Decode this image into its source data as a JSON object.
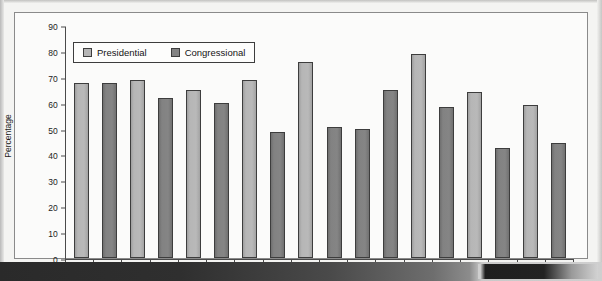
{
  "chart_data": {
    "type": "bar",
    "title": "",
    "xlabel": "",
    "ylabel": "Percentage",
    "ylim": [
      0,
      90
    ],
    "ytick_step": 10,
    "yticks": [
      0,
      10,
      20,
      30,
      40,
      50,
      60,
      70,
      80,
      90
    ],
    "grid": false,
    "legend_position": "top-left",
    "categories": [
      "1958",
      "1961",
      "1964",
      "1967",
      "1970",
      "1973",
      "1976",
      "1979",
      "1982",
      "1985",
      "1988",
      "1991",
      "1994",
      "1997",
      "2000",
      "2004",
      "2006",
      "2009"
    ],
    "series": [
      {
        "name": "Presidential",
        "color": "#b5b5b5"
      },
      {
        "name": "Congressional",
        "color": "#838383"
      }
    ],
    "bars": [
      {
        "category": "1958",
        "value": 68,
        "series": "Presidential"
      },
      {
        "category": "1961",
        "value": 68,
        "series": "Congressional"
      },
      {
        "category": "1964",
        "value": 69,
        "series": "Presidential"
      },
      {
        "category": "1967",
        "value": 62,
        "series": "Congressional"
      },
      {
        "category": "1970",
        "value": 65,
        "series": "Presidential"
      },
      {
        "category": "1973",
        "value": 60,
        "series": "Congressional"
      },
      {
        "category": "1976",
        "value": 69,
        "series": "Presidential"
      },
      {
        "category": "1979",
        "value": 49,
        "series": "Congressional"
      },
      {
        "category": "1982",
        "value": 76,
        "series": "Presidential"
      },
      {
        "category": "1985",
        "value": 51,
        "series": "Congressional"
      },
      {
        "category": "1988",
        "value": 50,
        "series": "Congressional"
      },
      {
        "category": "1991",
        "value": 65,
        "series": "Congressional"
      },
      {
        "category": "1994",
        "value": 79,
        "series": "Presidential"
      },
      {
        "category": "1997",
        "value": 58.5,
        "series": "Congressional"
      },
      {
        "category": "2000",
        "value": 64.5,
        "series": "Presidential"
      },
      {
        "category": "2004",
        "value": 42.5,
        "series": "Congressional"
      },
      {
        "category": "2006",
        "value": 59.5,
        "series": "Presidential"
      },
      {
        "category": "2009",
        "value": 44.5,
        "series": "Congressional"
      }
    ]
  },
  "legend": {
    "presidential_label": "Presidential",
    "congressional_label": "Congressional"
  },
  "axis": {
    "y_title": "Percentage"
  }
}
